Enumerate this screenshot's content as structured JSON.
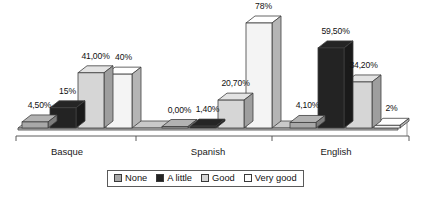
{
  "chart_data": {
    "type": "bar",
    "title": "",
    "subtitle": "",
    "xlabel": "",
    "ylabel": "",
    "grid": false,
    "legend_position": "bottom",
    "style": "3d-grouped-bar",
    "categories": [
      "Basque",
      "Spanish",
      "English"
    ],
    "ylim": [
      0,
      78
    ],
    "series": [
      {
        "name": "None",
        "color": "#a8a8a8",
        "values": [
          4.5,
          0.0,
          4.1
        ],
        "labels": [
          "4,50%",
          "0,00%",
          "4,10%"
        ]
      },
      {
        "name": "A little",
        "color": "#232323",
        "values": [
          15.0,
          1.4,
          59.5
        ],
        "labels": [
          "15%",
          "1,40%",
          "59,50%"
        ]
      },
      {
        "name": "Good",
        "color": "#d6d6d6",
        "values": [
          41.0,
          20.7,
          34.2
        ],
        "labels": [
          "41,00%",
          "20,70%",
          "34,20%"
        ]
      },
      {
        "name": "Very good",
        "color": "#f4f4f4",
        "values": [
          40.0,
          78.0,
          2.0
        ],
        "labels": [
          "40%",
          "78%",
          "2%"
        ]
      }
    ]
  },
  "legend": {
    "items": [
      {
        "label": "None",
        "color": "#a8a8a8"
      },
      {
        "label": "A little",
        "color": "#232323"
      },
      {
        "label": "Good",
        "color": "#d6d6d6"
      },
      {
        "label": "Very good",
        "color": "#fbfbfb"
      }
    ]
  },
  "axis": {
    "category_labels": [
      "Basque",
      "Spanish",
      "English"
    ]
  }
}
